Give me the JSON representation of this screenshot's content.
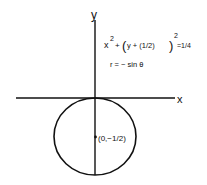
{
  "diagram": {
    "axes": {
      "x_label": "x",
      "y_label": "y"
    },
    "equation": {
      "base": "x",
      "exp1": "2",
      "plus": "+",
      "open_paren": "(",
      "inner": "y + (1/2)",
      "close_paren": ")",
      "exp2": "2",
      "rhs": "=1/4"
    },
    "polar_equation": "r = − sin θ",
    "center_label": "(0,−1/2)",
    "colors": {
      "stroke": "#111111",
      "background": "#ffffff"
    }
  }
}
